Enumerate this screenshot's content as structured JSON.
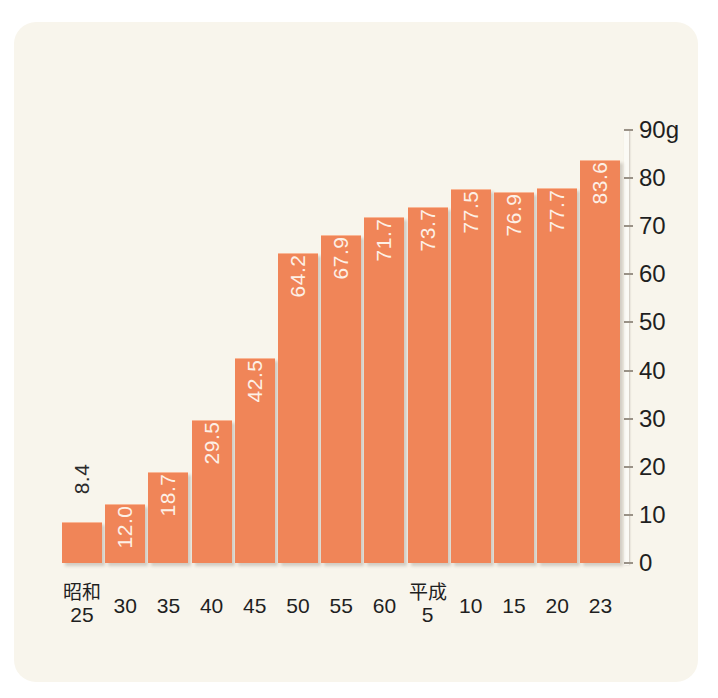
{
  "chart_data": {
    "type": "bar",
    "title": "",
    "subtitle": "",
    "xlabel": "",
    "ylabel": "",
    "unit_label": "90g",
    "unit": "g",
    "ylim": [
      0,
      90
    ],
    "grid": false,
    "legend": null,
    "axis_position": "right",
    "categories": [
      "昭和\n25",
      "30",
      "35",
      "40",
      "45",
      "50",
      "55",
      "60",
      "平成\n5",
      "10",
      "15",
      "20",
      "23"
    ],
    "category_eras": [
      {
        "era": "昭和",
        "year": "25"
      },
      {
        "era": "",
        "year": "30"
      },
      {
        "era": "",
        "year": "35"
      },
      {
        "era": "",
        "year": "40"
      },
      {
        "era": "",
        "year": "45"
      },
      {
        "era": "",
        "year": "50"
      },
      {
        "era": "",
        "year": "55"
      },
      {
        "era": "",
        "year": "60"
      },
      {
        "era": "平成",
        "year": "5"
      },
      {
        "era": "",
        "year": "10"
      },
      {
        "era": "",
        "year": "15"
      },
      {
        "era": "",
        "year": "20"
      },
      {
        "era": "",
        "year": "23"
      }
    ],
    "values": [
      8.4,
      12.0,
      18.7,
      29.5,
      42.5,
      64.2,
      67.9,
      71.7,
      73.7,
      77.5,
      76.9,
      77.7,
      83.6
    ],
    "value_labels": [
      "8.4",
      "12.0",
      "18.7",
      "29.5",
      "42.5",
      "64.2",
      "67.9",
      "71.7",
      "73.7",
      "77.5",
      "76.9",
      "77.7",
      "83.6"
    ],
    "label_placement": [
      "outside",
      "inside",
      "inside",
      "inside",
      "inside",
      "inside",
      "inside",
      "inside",
      "inside",
      "inside",
      "inside",
      "inside",
      "inside"
    ],
    "yticks": [
      0,
      10,
      20,
      30,
      40,
      50,
      60,
      70,
      80,
      90
    ],
    "ytick_labels": [
      "0",
      "10",
      "20",
      "30",
      "40",
      "50",
      "60",
      "70",
      "80",
      "90g"
    ],
    "colors": {
      "bar": "#f08558",
      "bar_highlight": "#f9b796",
      "panel_background": "#f8f5ec",
      "page_background": "#ffffff",
      "axis_line": "#fbfaf5",
      "tick": "#9a9287",
      "label_text": "#1f1f1f",
      "value_text_inside": "#fdf0e6",
      "value_text_outside": "#2b2b2b"
    }
  }
}
